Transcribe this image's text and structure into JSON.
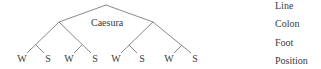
{
  "diagram": {
    "caesura_label": "Caesura",
    "leaves": [
      "W",
      "S",
      "W",
      "S",
      "W",
      "S",
      "W",
      "S"
    ],
    "levels": [
      {
        "label": "Line"
      },
      {
        "label": "Colon"
      },
      {
        "label": "Foot"
      },
      {
        "label": "Position"
      }
    ],
    "line_color": "#666666"
  }
}
